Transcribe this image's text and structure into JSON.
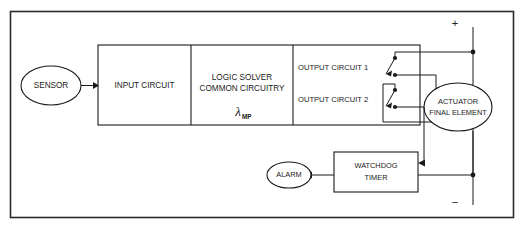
{
  "diagram": {
    "background_color": "#ffffff",
    "line_color": "#1a1a1a",
    "frame_color": "#2b2b2b",
    "blocks": {
      "sensor": {
        "label": "SENSOR",
        "shape": "ellipse"
      },
      "input_circuit": {
        "label": "INPUT CIRCUIT",
        "shape": "rect"
      },
      "logic_solver": {
        "line1": "LOGIC SOLVER",
        "line2": "COMMON CIRCUITRY",
        "symbol": "λ",
        "symbol_subscript": "MP",
        "shape": "rect"
      },
      "output_circuit_1": {
        "label": "OUTPUT CIRCUIT 1",
        "shape": "rect"
      },
      "output_circuit_2": {
        "label": "OUTPUT CIRCUIT 2",
        "shape": "rect"
      },
      "actuator": {
        "line1": "ACTUATOR",
        "line2": "FINAL ELEMENT",
        "shape": "ellipse"
      },
      "watchdog_timer": {
        "line1": "WATCHDOG",
        "line2": "TIMER",
        "shape": "rect"
      },
      "alarm": {
        "label": "ALARM",
        "shape": "ellipse"
      }
    },
    "power_rail": {
      "positive_label": "+",
      "negative_label": "−"
    },
    "switches": [
      {
        "name": "output-1-contact",
        "state": "open"
      },
      {
        "name": "output-2-contact",
        "state": "open"
      }
    ]
  }
}
